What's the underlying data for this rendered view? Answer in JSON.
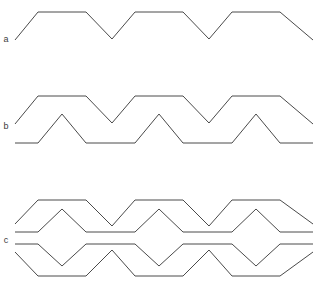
{
  "figure": {
    "background_color": "#ffffff",
    "line_color": "#4a4a4a",
    "line_width": 1,
    "width": 318,
    "height": 296
  },
  "labels": {
    "a": "a",
    "b": "b",
    "c": "c"
  },
  "chart_data": {
    "type": "line",
    "title": "",
    "xlabel": "",
    "ylabel": "",
    "grid": false,
    "legend": "none",
    "xlim": [
      0,
      318
    ],
    "ylim": [
      0,
      296
    ],
    "note": "Three stacked trapezoidal / triangular waveform groups labelled a, b and c. Coordinates are in image pixel space with y increasing downward.",
    "panels": [
      {
        "label": "a",
        "label_position": {
          "x": 6,
          "y": 40
        },
        "trace_count": 1,
        "period": 97,
        "traces": [
          {
            "name": "trapezoid-wave",
            "points": [
              [
                15,
                40
              ],
              [
                38,
                12
              ],
              [
                86,
                12
              ],
              [
                112,
                39
              ],
              [
                135,
                12
              ],
              [
                183,
                12
              ],
              [
                209,
                39
              ],
              [
                232,
                12
              ],
              [
                280,
                12
              ],
              [
                313,
                40
              ]
            ]
          }
        ]
      },
      {
        "label": "b",
        "label_position": {
          "x": 6,
          "y": 127
        },
        "trace_count": 2,
        "period": 97,
        "traces": [
          {
            "name": "upper-trapezoid-wave",
            "points": [
              [
                15,
                124
              ],
              [
                38,
                96
              ],
              [
                86,
                96
              ],
              [
                112,
                123
              ],
              [
                135,
                96
              ],
              [
                183,
                96
              ],
              [
                209,
                123
              ],
              [
                232,
                96
              ],
              [
                280,
                96
              ],
              [
                313,
                124
              ]
            ]
          },
          {
            "name": "lower-triangle-wave",
            "points": [
              [
                15,
                143
              ],
              [
                38,
                143
              ],
              [
                62,
                114
              ],
              [
                86,
                143
              ],
              [
                135,
                143
              ],
              [
                159,
                114
              ],
              [
                183,
                143
              ],
              [
                232,
                143
              ],
              [
                256,
                114
              ],
              [
                280,
                143
              ],
              [
                313,
                143
              ]
            ]
          }
        ]
      },
      {
        "label": "c",
        "label_position": {
          "x": 6,
          "y": 241
        },
        "trace_count": 4,
        "period": 97,
        "traces": [
          {
            "name": "outer-upper-trapezoid-wave",
            "points": [
              [
                15,
                224
              ],
              [
                38,
                200
              ],
              [
                86,
                200
              ],
              [
                112,
                226
              ],
              [
                135,
                200
              ],
              [
                183,
                200
              ],
              [
                209,
                226
              ],
              [
                232,
                200
              ],
              [
                280,
                200
              ],
              [
                313,
                224
              ]
            ]
          },
          {
            "name": "inner-upper-triangle-wave",
            "points": [
              [
                15,
                232
              ],
              [
                38,
                232
              ],
              [
                62,
                209
              ],
              [
                86,
                232
              ],
              [
                135,
                232
              ],
              [
                159,
                209
              ],
              [
                183,
                232
              ],
              [
                232,
                232
              ],
              [
                256,
                209
              ],
              [
                280,
                232
              ],
              [
                313,
                232
              ]
            ]
          },
          {
            "name": "inner-lower-triangle-wave",
            "points": [
              [
                15,
                244
              ],
              [
                38,
                244
              ],
              [
                62,
                266
              ],
              [
                86,
                244
              ],
              [
                135,
                244
              ],
              [
                159,
                266
              ],
              [
                183,
                244
              ],
              [
                232,
                244
              ],
              [
                256,
                266
              ],
              [
                280,
                244
              ],
              [
                313,
                244
              ]
            ]
          },
          {
            "name": "outer-lower-trapezoid-wave",
            "points": [
              [
                15,
                252
              ],
              [
                38,
                276
              ],
              [
                86,
                276
              ],
              [
                112,
                250
              ],
              [
                135,
                276
              ],
              [
                183,
                276
              ],
              [
                209,
                250
              ],
              [
                232,
                276
              ],
              [
                280,
                276
              ],
              [
                313,
                252
              ]
            ]
          }
        ]
      }
    ]
  }
}
